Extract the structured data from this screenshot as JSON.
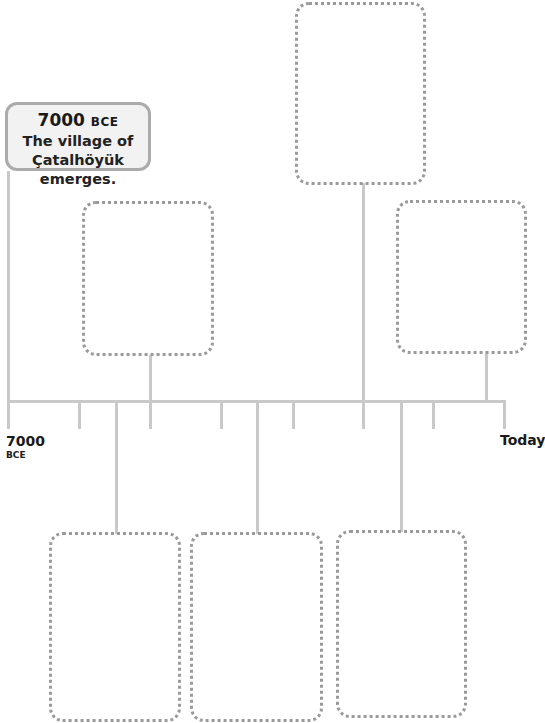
{
  "timeline": {
    "start_label": {
      "year": "7000",
      "era": "BCE"
    },
    "end_label": "Today",
    "colors": {
      "line": "#c9c9c9",
      "dots": "#9a9a9a",
      "label_border": "#ababab",
      "label_fill": "#f2f2f2"
    }
  },
  "event_label": {
    "year": "7000",
    "era": "BCE",
    "line1": "The village of",
    "line2": "Çatalhöyük emerges."
  },
  "empty_boxes": [
    {
      "position": "top-center",
      "content": ""
    },
    {
      "position": "upper-left",
      "content": ""
    },
    {
      "position": "upper-right",
      "content": ""
    },
    {
      "position": "lower-left",
      "content": ""
    },
    {
      "position": "lower-middle",
      "content": ""
    },
    {
      "position": "lower-right",
      "content": ""
    }
  ],
  "side_credit": "All Rights Reserved"
}
